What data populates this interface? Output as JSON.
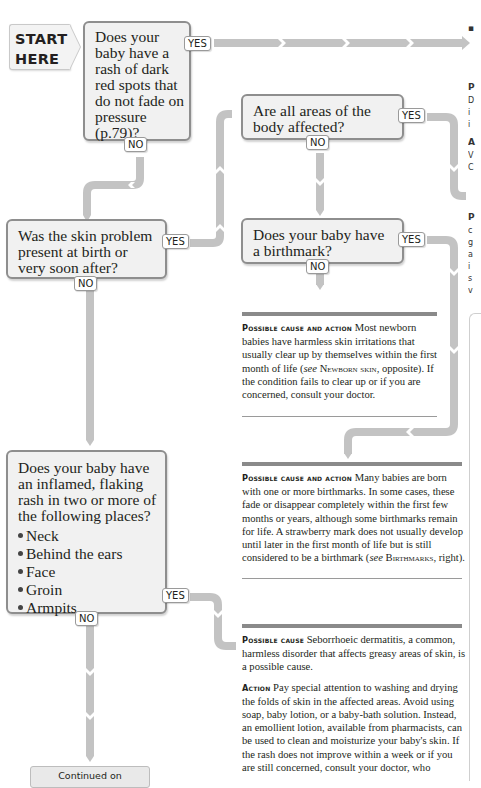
{
  "start": {
    "line1": "START",
    "line2": "HERE"
  },
  "questions": [
    {
      "id": "q1",
      "text": "Does your baby have a rash of dark red spots that do not fade on pressure (p.79)?",
      "yes": "YES",
      "no": "NO"
    },
    {
      "id": "q2",
      "text": "Was the skin problem present at birth or very soon after?",
      "yes": "YES",
      "no": "NO"
    },
    {
      "id": "q3",
      "text": "Are all areas of the body affected?",
      "yes": "YES",
      "no": "NO"
    },
    {
      "id": "q4",
      "text": "Does your baby have a birthmark?",
      "yes": "YES",
      "no": "NO"
    },
    {
      "id": "q5",
      "text": "Does your baby have an inflamed, flaking rash in two or more of the following places?",
      "bullets": [
        "Neck",
        "Behind the ears",
        "Face",
        "Groin",
        "Armpits"
      ],
      "yes": "YES",
      "no": "NO"
    }
  ],
  "results": {
    "newborn": {
      "heading": "Possible cause and action",
      "body_pre": " Most newborn babies have harmless skin irritations that usually clear up by themselves within the first month of life (",
      "see": "see",
      "ref": "Newborn skin",
      "body_post": ", opposite). If the condition fails to clear up or if you are concerned, consult your doctor."
    },
    "birthmark": {
      "heading": "Possible cause and action",
      "body_pre": " Many babies are born with one or more birthmarks. In some cases, these fade or disappear completely within the first few months or years, although some birthmarks remain for life. A strawberry mark does not usually develop until later in the first month of life but is still considered to be a birthmark (",
      "see": "see",
      "ref": "Birthmarks",
      "body_post": ", right)."
    },
    "seborrhoeic": {
      "cause_heading": "Possible cause",
      "cause_body": " Seborrhoeic dermatitis, a common, harmless disorder that affects greasy areas of skin, is a possible cause.",
      "action_heading": "Action",
      "action_body": " Pay special attention to washing and drying the folds of skin in the affected areas. Avoid using soap, baby lotion, or a baby-bath solution. Instead, an emollient lotion, available from pharmacists, can be used to clean and moisturize your baby's skin. If the rash does not improve within a week or if you are still concerned, consult your doctor, who"
    }
  },
  "continued": {
    "label": "Continued on"
  },
  "edge_column": {
    "letters": [
      "▪",
      "—",
      "P",
      "D",
      "i",
      "i",
      "A",
      "V",
      "C",
      "c",
      "—",
      "▪",
      "P",
      "c",
      "g",
      "a",
      "i",
      "s",
      "v",
      "—"
    ]
  },
  "colors": {
    "arrow": "#c3c3c3",
    "box_border": "#8e8e8e",
    "box_fill": "#f1f1f1",
    "bar": "#8a8a8a"
  }
}
